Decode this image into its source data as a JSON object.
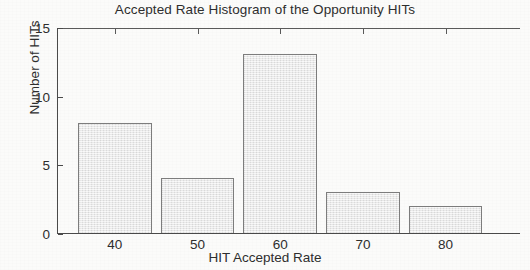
{
  "chart_data": {
    "type": "bar",
    "title": "Accepted Rate Histogram of the Opportunity HITs",
    "xlabel": "HIT Accepted Rate",
    "ylabel": "Number of HITs",
    "categories": [
      "40",
      "50",
      "60",
      "70",
      "80"
    ],
    "values": [
      8,
      4,
      13,
      3,
      2
    ],
    "bin_centers": [
      40,
      50,
      60,
      70,
      80
    ],
    "xlim": [
      33,
      89
    ],
    "ylim": [
      0,
      15
    ],
    "xticks": [
      40,
      50,
      60,
      70,
      80
    ],
    "yticks": [
      0,
      5,
      10,
      15
    ],
    "grid": false,
    "legend": null,
    "bar_fill_color": "#e9e9e9",
    "bar_edge_color": "#7d7d7d",
    "axis_color": "#4a4a4a",
    "text_color": "#2e2e2e",
    "background_color": "#fbfbfa"
  }
}
